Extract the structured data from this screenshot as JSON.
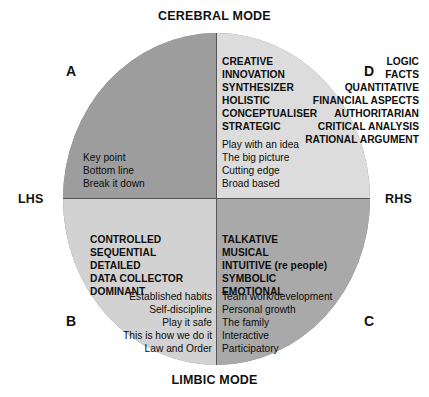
{
  "diagram": {
    "axis_labels": {
      "top": "CEREBRAL MODE",
      "bottom": "LIMBIC MODE",
      "left": "LHS",
      "right": "RHS"
    },
    "colors": {
      "quadrant_a": "#9d9d9d",
      "quadrant_d": "#dcdcdc",
      "quadrant_b": "#d2d2d2",
      "quadrant_c": "#a9a9a9",
      "outline": "#555555",
      "text": "#0d0d0d",
      "background": "#ffffff"
    },
    "quadrants": [
      {
        "key": "A",
        "letter": "A",
        "position": "top-left",
        "traits": [
          "LOGIC",
          "FACTS",
          "QUANTITATIVE",
          "FINANCIAL ASPECTS",
          "AUTHORITARIAN",
          "CRITICAL ANALYSIS",
          "RATIONAL ARGUMENT"
        ],
        "phrases": [
          "Key point",
          "Bottom line",
          "Break it down"
        ]
      },
      {
        "key": "D",
        "letter": "D",
        "position": "top-right",
        "traits": [
          "CREATIVE",
          "INNOVATION",
          "SYNTHESIZER",
          "HOLISTIC",
          "CONCEPTUALISER",
          "STRATEGIC"
        ],
        "phrases": [
          "Play with an idea",
          "The big picture",
          "Cutting edge",
          "Broad based"
        ]
      },
      {
        "key": "B",
        "letter": "B",
        "position": "bottom-left",
        "traits": [
          "CONTROLLED",
          "SEQUENTIAL",
          "DETAILED",
          "DATA COLLECTOR",
          "DOMINANT"
        ],
        "phrases": [
          "Established habits",
          "Self-discipline",
          "Play it safe",
          "This is how we do it",
          "Law and Order"
        ]
      },
      {
        "key": "C",
        "letter": "C",
        "position": "bottom-right",
        "traits": [
          "TALKATIVE",
          "MUSICAL",
          "INTUITIVE (re people)",
          "SYMBOLIC",
          "EMOTIONAL"
        ],
        "phrases": [
          "Team work/development",
          "Personal growth",
          "The family",
          "Interactive",
          "Participatory"
        ]
      }
    ]
  }
}
